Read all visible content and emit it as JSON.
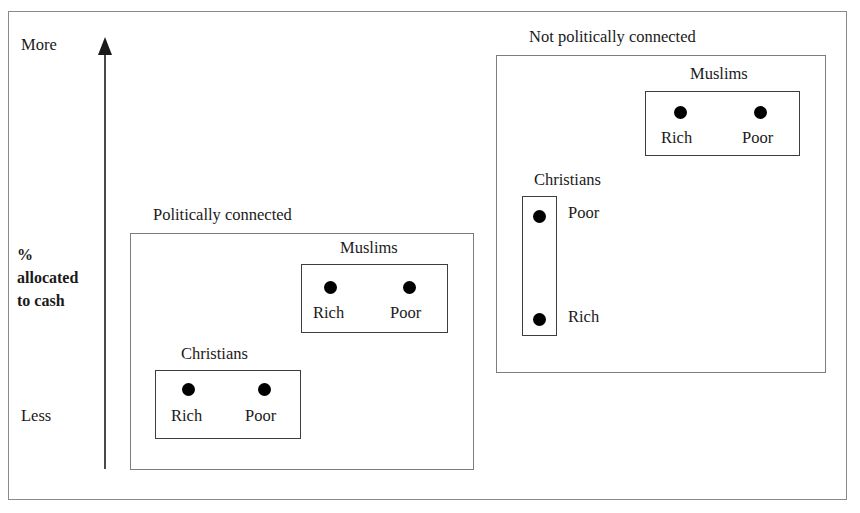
{
  "axis": {
    "top_label": "More",
    "bottom_label": "Less",
    "metric_label": "%\nallocated\nto cash",
    "arrow_direction": "up"
  },
  "groups": [
    {
      "id": "politically-connected",
      "title": "Politically connected",
      "clusters": [
        {
          "id": "connected-muslims",
          "title": "Muslims",
          "orientation": "horizontal",
          "points": [
            {
              "label": "Rich",
              "level": "low"
            },
            {
              "label": "Poor",
              "level": "low"
            }
          ]
        },
        {
          "id": "connected-christians",
          "title": "Christians",
          "orientation": "horizontal",
          "points": [
            {
              "label": "Rich",
              "level": "lowest"
            },
            {
              "label": "Poor",
              "level": "lowest"
            }
          ]
        }
      ]
    },
    {
      "id": "not-politically-connected",
      "title": "Not politically connected",
      "clusters": [
        {
          "id": "notconnected-muslims",
          "title": "Muslims",
          "orientation": "horizontal",
          "points": [
            {
              "label": "Rich",
              "level": "highest"
            },
            {
              "label": "Poor",
              "level": "highest"
            }
          ]
        },
        {
          "id": "notconnected-christians",
          "title": "Christians",
          "orientation": "vertical",
          "points": [
            {
              "label": "Poor",
              "level": "high"
            },
            {
              "label": "Rich",
              "level": "medium"
            }
          ]
        }
      ]
    }
  ],
  "chart_data": {
    "type": "scatter",
    "title": "",
    "xlabel": "",
    "ylabel": "% allocated to cash",
    "ytick_labels": [
      "Less",
      "More"
    ],
    "ylim_labels": [
      "Less",
      "More"
    ],
    "grid": false,
    "legend": "none",
    "annotations": [
      "Politically connected",
      "Not politically connected",
      "Muslims",
      "Christians"
    ],
    "series": [
      {
        "name": "Politically connected - Muslims",
        "points": [
          {
            "label": "Rich",
            "x": 330,
            "y": 288
          },
          {
            "label": "Poor",
            "x": 409,
            "y": 288
          }
        ]
      },
      {
        "name": "Politically connected - Christians",
        "points": [
          {
            "label": "Rich",
            "x": 188,
            "y": 390
          },
          {
            "label": "Poor",
            "x": 264,
            "y": 390
          }
        ]
      },
      {
        "name": "Not politically connected - Muslims",
        "points": [
          {
            "label": "Rich",
            "x": 680,
            "y": 113
          },
          {
            "label": "Poor",
            "x": 760,
            "y": 113
          }
        ]
      },
      {
        "name": "Not politically connected - Christians",
        "points": [
          {
            "label": "Poor",
            "x": 539,
            "y": 217
          },
          {
            "label": "Rich",
            "x": 539,
            "y": 320
          }
        ]
      }
    ]
  },
  "colors": {
    "point": "#000000",
    "frame": "#8a8a8a",
    "box": "#3d3d3d",
    "text": "#1a1a1a",
    "background": "#ffffff"
  }
}
